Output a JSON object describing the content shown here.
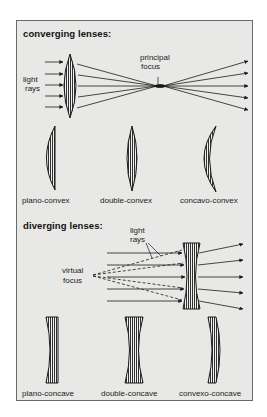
{
  "converging": {
    "heading": "converging lenses:",
    "light_rays_label_line1": "light",
    "light_rays_label_line2": "rays",
    "focus_label_line1": "principal",
    "focus_label_line2": "focus",
    "lens_types": [
      {
        "label": "plano-convex"
      },
      {
        "label": "double-convex"
      },
      {
        "label": "concavo-convex"
      }
    ]
  },
  "diverging": {
    "heading": "diverging lenses:",
    "light_rays_label_line1": "light",
    "light_rays_label_line2": "rays",
    "focus_label_line1": "virtual",
    "focus_label_line2": "focus",
    "lens_types": [
      {
        "label": "plano-concave"
      },
      {
        "label": "double-concave"
      },
      {
        "label": "convexo-concave"
      }
    ]
  },
  "colors": {
    "background": "#e8e8e6",
    "ink": "#1a1a1a",
    "frame_border": "#6a6a6a"
  }
}
